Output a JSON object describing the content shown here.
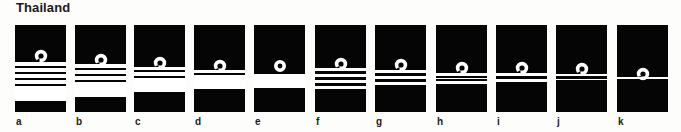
{
  "title": "Thailand",
  "colors": {
    "board": "#050505",
    "lace": "#ffffff",
    "background": "#fdfdfb",
    "text": "#1a1a1a"
  },
  "boards": [
    {
      "label": "a",
      "x": 15,
      "loop_y": 31,
      "stripes": [
        [
          37,
          41
        ],
        [
          43,
          47
        ],
        [
          49,
          53
        ],
        [
          55,
          59
        ],
        [
          61,
          76
        ]
      ]
    },
    {
      "label": "b",
      "x": 75,
      "loop_y": 35,
      "stripes": [
        [
          39,
          43
        ],
        [
          45,
          49
        ],
        [
          51,
          55
        ],
        [
          57,
          72
        ]
      ]
    },
    {
      "label": "c",
      "x": 134,
      "loop_y": 38,
      "stripes": [
        [
          42,
          45
        ],
        [
          47,
          51
        ],
        [
          53,
          67
        ]
      ]
    },
    {
      "label": "d",
      "x": 194,
      "loop_y": 41,
      "stripes": [
        [
          45,
          48
        ],
        [
          50,
          64
        ]
      ]
    },
    {
      "label": "e",
      "x": 254,
      "loop_y": 41,
      "ring": true,
      "stripes": [
        [
          49,
          63
        ]
      ]
    },
    {
      "label": "f",
      "x": 315,
      "loop_y": 39,
      "stripes": [
        [
          43,
          46
        ],
        [
          49,
          52
        ],
        [
          55,
          58
        ],
        [
          61,
          64
        ]
      ]
    },
    {
      "label": "g",
      "x": 375,
      "loop_y": 40,
      "stripes": [
        [
          45,
          48
        ],
        [
          51,
          54
        ],
        [
          57,
          60
        ]
      ]
    },
    {
      "label": "h",
      "x": 436,
      "loop_y": 43,
      "stripes": [
        [
          48,
          51
        ],
        [
          53,
          54
        ],
        [
          56,
          59
        ]
      ]
    },
    {
      "label": "i",
      "x": 496,
      "loop_y": 43,
      "stripes": [
        [
          48,
          51
        ],
        [
          54,
          57
        ]
      ]
    },
    {
      "label": "j",
      "x": 556,
      "loop_y": 44,
      "stripes": [
        [
          49,
          51
        ],
        [
          54,
          55
        ]
      ]
    },
    {
      "label": "k",
      "x": 617,
      "loop_y": 49,
      "stripes": [
        [
          52,
          54
        ]
      ]
    }
  ]
}
